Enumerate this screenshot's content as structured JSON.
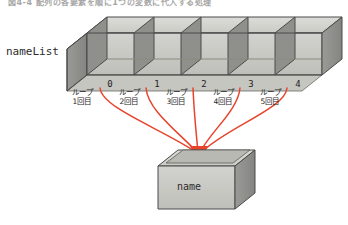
{
  "figure": {
    "caption": "図4-4  配列の各要素を順に1つの変数に代入する処理",
    "array_label": "nameList",
    "target_label": "name",
    "array_cells": 5,
    "indices": [
      "0",
      "1",
      "2",
      "3",
      "4"
    ],
    "loop_labels": [
      {
        "line1": "ループ",
        "line2": "1回目"
      },
      {
        "line1": "ループ",
        "line2": "2回目"
      },
      {
        "line1": "ループ",
        "line2": "3回目"
      },
      {
        "line1": "ループ",
        "line2": "4回目"
      },
      {
        "line1": "ループ",
        "line2": "5回目"
      }
    ],
    "colors": {
      "arrow": "#e8442c",
      "face_front": "#c9c9c5",
      "face_top": "#d8d8d4",
      "face_side": "#8d8d8a",
      "outline": "#4a4a4a",
      "text": "#222222"
    }
  }
}
